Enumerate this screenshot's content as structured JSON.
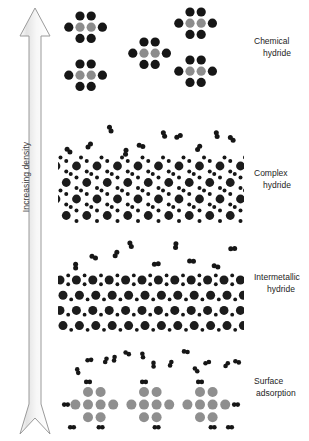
{
  "axis": {
    "label": "Increasing density",
    "direction": "up",
    "arrow_icon": "up-arrow-icon",
    "shaft_color": "#f2f2f2",
    "outline_color": "#9a9a9a"
  },
  "legend_colors": {
    "hydrogen_atom": "#161616",
    "metal_atom_dark": "#1c1c1c",
    "metal_atom_gray": "#8c8c8c",
    "substrate_gray": "#8f8f8f",
    "background": "#ffffff",
    "text": "#1d1d1d"
  },
  "bands": [
    {
      "id": "chemical",
      "label_line1": "Chemical",
      "label_line2": "hydride",
      "description": "Discrete molecular clusters: pairs of gray metal atoms capped above and below by black hydrogen atoms.",
      "cluster_count": 5,
      "cluster_pattern": "2x3 grid, black-gray-black rows",
      "free_h2_count": 0
    },
    {
      "id": "complex",
      "label_line1": "Complex",
      "label_line2": "hydride",
      "description": "Open staggered lattice of large dark spheres with small hydrogen dots, free hydrogen molecules in gas phase above.",
      "lattice_rows": 4,
      "lattice_cols": 9,
      "free_h2_count": 10
    },
    {
      "id": "intermetallic",
      "label_line1": "Intermetallic",
      "label_line2": "hydride",
      "description": "Dense square lattice of large dark metal spheres with small hydrogen atoms in interstitial sites, free hydrogen molecules above.",
      "lattice_rows": 4,
      "lattice_cols": 11,
      "free_h2_count": 9
    },
    {
      "id": "surface",
      "label_line1": "Surface",
      "label_line2": "adsorption",
      "description": "Gray substrate clusters with hydrogen molecules adsorbed on the outer surfaces and free hydrogen molecules in the gas phase above.",
      "substrate_clusters": 3,
      "adsorbed_h2_count": 12,
      "free_h2_count": 13
    }
  ]
}
